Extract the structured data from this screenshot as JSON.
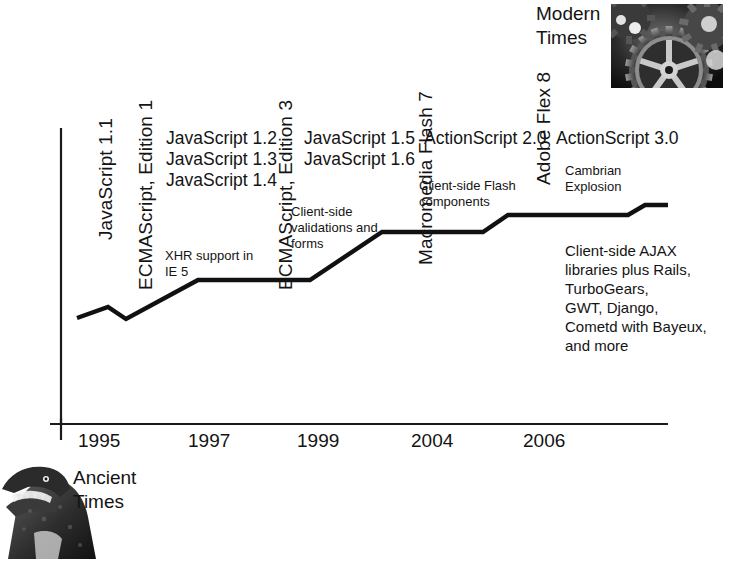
{
  "chart_data": {
    "type": "line",
    "xlabel": "",
    "ylabel": "",
    "grid": false,
    "legend": "none",
    "axis_years": [
      "1995",
      "1997",
      "1999",
      "2004",
      "2006"
    ],
    "x_tick_px": [
      78,
      188,
      297,
      411,
      523
    ],
    "series": [
      {
        "name": "Client-side capability",
        "points_px": [
          [
            77,
            318
          ],
          [
            108,
            307
          ],
          [
            126,
            319
          ],
          [
            198,
            280
          ],
          [
            310,
            280
          ],
          [
            382,
            232
          ],
          [
            483,
            232
          ],
          [
            508,
            215
          ],
          [
            628,
            215
          ],
          [
            645,
            205
          ],
          [
            668,
            205
          ]
        ]
      }
    ],
    "era_start": {
      "label": "Ancient\nTimes",
      "icon": "dinosaur-photo"
    },
    "era_end": {
      "label": "Modern\nTimes",
      "icon": "gears-photo"
    }
  },
  "eras": {
    "ancient": {
      "label": "Ancient\nTimes"
    },
    "modern": {
      "label": "Modern\nTimes"
    }
  },
  "vertical_labels": [
    {
      "name": "javascript-1-1",
      "text": "JavaScript 1.1"
    },
    {
      "name": "ecmascript-edition-1",
      "text": "ECMAScript, Edition 1"
    },
    {
      "name": "ecmascript-edition-3",
      "text": "ECMAScript, Edition 3"
    },
    {
      "name": "macromedia-flash-7",
      "text": "Macromedia Flash 7"
    },
    {
      "name": "adobe-flex-8",
      "text": "Adobe Flex 8"
    }
  ],
  "horizontal_labels": [
    {
      "name": "javascript-12-13-14",
      "text": "JavaScript 1.2\nJavaScript 1.3\nJavaScript 1.4"
    },
    {
      "name": "javascript-15-16",
      "text": "JavaScript 1.5\nJavaScript 1.6"
    },
    {
      "name": "actionscript-20",
      "text": "ActionScript 2.0"
    },
    {
      "name": "actionscript-30",
      "text": "ActionScript 3.0"
    }
  ],
  "notes": [
    {
      "name": "xhr-support",
      "text": "XHR support in\nIE 5"
    },
    {
      "name": "client-side-forms",
      "text": "Client-side\nvalidations and\nforms"
    },
    {
      "name": "client-side-flash",
      "text": "Client-side Flash\ncomponents"
    },
    {
      "name": "cambrian-explosion",
      "text": "Cambrian\nExplosion"
    },
    {
      "name": "client-side-ajax",
      "text": "Client-side AJAX\nlibraries plus Rails,\nTurboGears,\nGWT, Django,\nCometd with Bayeux,\nand more"
    }
  ],
  "years": [
    "1995",
    "1997",
    "1999",
    "2004",
    "2006"
  ],
  "colors": {
    "ink": "#141414",
    "axis": "#1a1a1a",
    "line": "#111111",
    "background": "#ffffff"
  }
}
